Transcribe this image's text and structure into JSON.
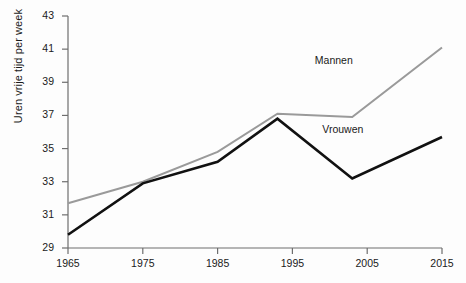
{
  "chart_data": {
    "type": "line",
    "title": "",
    "subtitle": "",
    "xlabel": "",
    "ylabel": "Uren vrije tijd per week",
    "x": [
      1965,
      1975,
      1985,
      1995,
      2005,
      2015
    ],
    "xtick_labels": [
      "1965",
      "1975",
      "1985",
      "1995",
      "2005",
      "2015"
    ],
    "ytick_labels": [
      "29",
      "31",
      "33",
      "35",
      "37",
      "39",
      "41",
      "43"
    ],
    "ytick_values": [
      29,
      31,
      33,
      35,
      37,
      39,
      41,
      43
    ],
    "xlim": [
      1965,
      2015
    ],
    "ylim": [
      29,
      43
    ],
    "grid": false,
    "legend_position": "inline-right",
    "series": [
      {
        "name": "Mannen",
        "color": "#9a9a9a",
        "label_x": 1998,
        "label_y": 40.3,
        "points": [
          {
            "x": 1965,
            "y": 31.7
          },
          {
            "x": 1975,
            "y": 33.0
          },
          {
            "x": 1985,
            "y": 34.8
          },
          {
            "x": 1993,
            "y": 37.1
          },
          {
            "x": 2003,
            "y": 36.9
          },
          {
            "x": 2015,
            "y": 41.1
          }
        ]
      },
      {
        "name": "Vrouwen",
        "color": "#111111",
        "label_x": 1999,
        "label_y": 36.1,
        "points": [
          {
            "x": 1965,
            "y": 29.8
          },
          {
            "x": 1975,
            "y": 32.9
          },
          {
            "x": 1985,
            "y": 34.2
          },
          {
            "x": 1993,
            "y": 36.8
          },
          {
            "x": 2003,
            "y": 33.2
          },
          {
            "x": 2015,
            "y": 35.7
          }
        ]
      }
    ]
  },
  "axes": {
    "axis_color": "#6e6e6e",
    "y_label": "Uren vrije tijd per week"
  }
}
